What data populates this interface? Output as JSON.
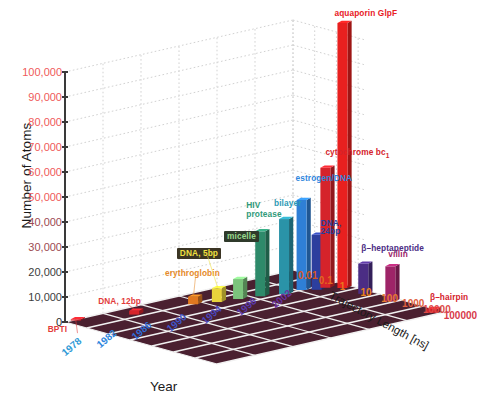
{
  "chart_data": {
    "type": "bar",
    "title": "",
    "xlabel": "Year",
    "ylabel": "Number of Atoms",
    "zlabel": "Trajectory Length [ns]",
    "ylim": [
      0,
      100000
    ],
    "yticks": [
      "0",
      "10,000",
      "20,000",
      "30,000",
      "40,000",
      "50,000",
      "60,000",
      "70,000",
      "80,000",
      "90,000",
      "100,000"
    ],
    "xticks": [
      "1978",
      "1982",
      "1986",
      "1990",
      "1994",
      "1998",
      "2002"
    ],
    "zticks": [
      "0.01",
      "0.1",
      "1",
      "10",
      "100",
      "1000",
      "10000",
      "100000"
    ],
    "grid": true,
    "legend": "none",
    "points": [
      {
        "label": "BPTI",
        "year": 1978,
        "atoms": 500,
        "traj": 0.01,
        "color": "#d5232b",
        "label_color": "#e23b3b",
        "label_bg": "none"
      },
      {
        "label": "DNA, 12bp",
        "year": 1983,
        "atoms": 1500,
        "traj": 0.05,
        "color": "#d5232b",
        "label_color": "#e23b3b",
        "label_bg": "none"
      },
      {
        "label": "erythroglobin",
        "year": 1989,
        "atoms": 3000,
        "traj": 0.1,
        "color": "#e07820",
        "label_color": "#e58a2a",
        "label_bg": "none"
      },
      {
        "label": "DNA, 5bp",
        "year": 1991,
        "atoms": 5500,
        "traj": 0.2,
        "color": "#e8d43c",
        "label_color": "#f0e040",
        "label_bg": "#3b3524"
      },
      {
        "label": "micelle",
        "year": 1993,
        "atoms": 8000,
        "traj": 0.3,
        "color": "#7cc47c",
        "label_color": "#9ada8f",
        "label_bg": "#2f3a2b"
      },
      {
        "label": "HIV protease",
        "year": 1995,
        "atoms": 26000,
        "traj": 0.5,
        "color": "#2e8a6a",
        "label_color": "#2f9a79",
        "label_bg": "none"
      },
      {
        "label": "bilayer",
        "year": 1997,
        "atoms": 30000,
        "traj": 1,
        "color": "#2a93a8",
        "label_color": "#2d9ab4",
        "label_bg": "none"
      },
      {
        "label": "estrogen/DNA",
        "year": 1999,
        "atoms": 36000,
        "traj": 1,
        "color": "#2f7fd6",
        "label_color": "#2f86dd",
        "label_bg": "none"
      },
      {
        "label": "DNA, 24bp",
        "year": 2000,
        "atoms": 22000,
        "traj": 2,
        "color": "#2c3f9e",
        "label_color": "#2a3f9e",
        "label_bg": "none"
      },
      {
        "label": "cytochrome bc",
        "label_sub": "1",
        "year": 2001,
        "atoms": 48000,
        "traj": 2,
        "color": "#d5232b",
        "label_color": "#d5232b",
        "label_bg": "none"
      },
      {
        "label": "aquaporin GlpF",
        "year": 2002,
        "atoms": 106000,
        "traj": 5,
        "color": "#e8201f",
        "label_color": "#e8201f",
        "label_bg": "none"
      },
      {
        "label": "β–heptapeptide",
        "year": 2002,
        "atoms": 12000,
        "traj": 50,
        "color": "#4b2d84",
        "label_color": "#4b2d84",
        "label_bg": "none"
      },
      {
        "label": "villin",
        "year": 2002,
        "atoms": 14000,
        "traj": 1000,
        "color": "#9e2468",
        "label_color": "#9e2468",
        "label_bg": "none"
      },
      {
        "label": "β–hairpin",
        "year": 2002,
        "atoms": 1500,
        "traj": 100000,
        "color": "#d5232b",
        "label_color": "#d5232b",
        "label_bg": "none"
      }
    ]
  },
  "axes": {
    "y_title": "Number of Atoms",
    "x_title": "Year",
    "z_title": "Trajectory Length [ns]"
  }
}
